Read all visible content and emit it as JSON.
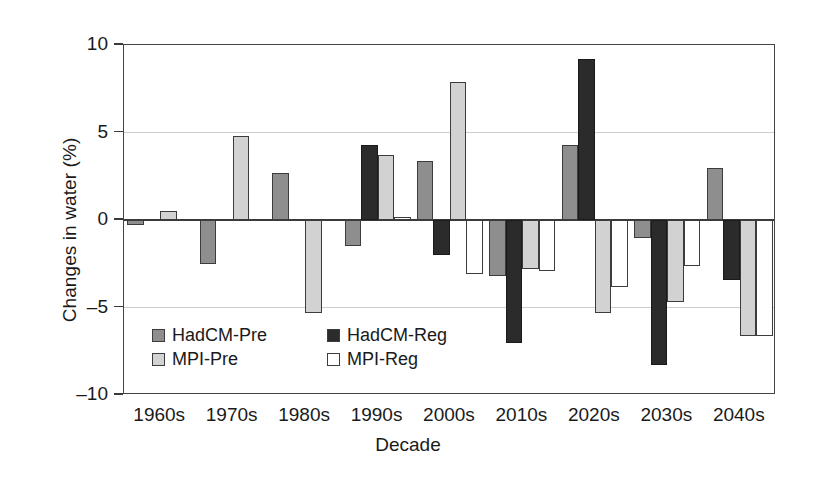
{
  "chart_data": {
    "type": "bar",
    "title": "",
    "xlabel": "Decade",
    "ylabel": "Changes in water (%)",
    "categories": [
      "1960s",
      "1970s",
      "1980s",
      "1990s",
      "2000s",
      "2010s",
      "2020s",
      "2030s",
      "2040s"
    ],
    "ylim": [
      -10,
      10
    ],
    "yticks": [
      10,
      5,
      0,
      -5,
      -10
    ],
    "ytick_labels": [
      "10",
      "5",
      "0",
      "–5",
      "–10"
    ],
    "grid": true,
    "legend_position": "inside-lower-left",
    "series": [
      {
        "name": "HadCM-Pre",
        "color": "#8e8e8e",
        "values": [
          -0.3,
          -2.5,
          2.7,
          -1.5,
          3.4,
          -3.2,
          4.3,
          -1.0,
          3.0
        ]
      },
      {
        "name": "HadCM-Reg",
        "color": "#2b2b2b",
        "values": [
          null,
          null,
          null,
          4.3,
          -2.0,
          -7.0,
          9.2,
          -8.3,
          -3.4
        ]
      },
      {
        "name": "MPI-Pre",
        "color": "#d2d2d2",
        "values": [
          0.5,
          4.8,
          -5.3,
          3.7,
          7.9,
          -2.8,
          -5.3,
          -4.7,
          -6.6
        ]
      },
      {
        "name": "MPI-Reg",
        "color": "#ffffff",
        "values": [
          null,
          null,
          null,
          0.2,
          -3.1,
          -2.9,
          -3.8,
          -2.6,
          -6.6
        ]
      }
    ]
  },
  "axis": {
    "y_title": "Changes in water (%)",
    "x_title": "Decade"
  },
  "legend": {
    "items": [
      {
        "label": "HadCM-Pre",
        "swatch": "#8e8e8e"
      },
      {
        "label": "HadCM-Reg",
        "swatch": "#2b2b2b"
      },
      {
        "label": "MPI-Pre",
        "swatch": "#d2d2d2"
      },
      {
        "label": "MPI-Reg",
        "swatch": "#ffffff"
      }
    ]
  }
}
